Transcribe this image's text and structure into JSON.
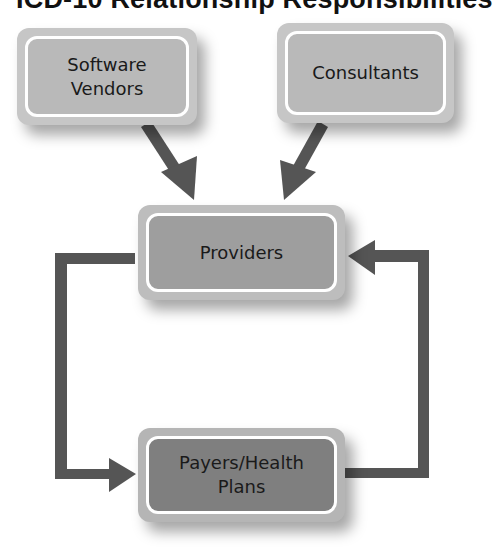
{
  "title": "ICD-10 Relationship Responsibilities",
  "colors": {
    "arrow": "#555555",
    "box_light": "#b9b9b9",
    "box_mid": "#9e9e9e",
    "box_dark": "#7f7f7f",
    "box_border": "#ffffff"
  },
  "nodes": [
    {
      "id": "software-vendors",
      "label": "Software\nVendors"
    },
    {
      "id": "consultants",
      "label": "Consultants"
    },
    {
      "id": "providers",
      "label": "Providers"
    },
    {
      "id": "payers",
      "label": "Payers/Health\nPlans"
    }
  ],
  "edges": [
    {
      "from": "software-vendors",
      "to": "providers"
    },
    {
      "from": "consultants",
      "to": "providers"
    },
    {
      "from": "providers",
      "to": "payers"
    },
    {
      "from": "payers",
      "to": "providers"
    }
  ]
}
